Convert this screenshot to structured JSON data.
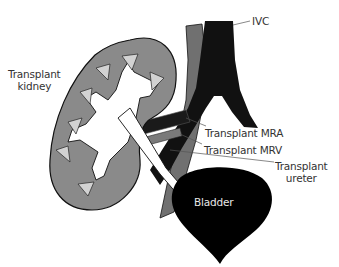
{
  "diagram": {
    "labels": {
      "kidney_line1": "Transplant",
      "kidney_line2": "kidney",
      "ivc": "IVC",
      "mra": "Transplant MRA",
      "mrv": "Transplant MRV",
      "ureter_line1": "Transplant",
      "ureter_line2": "ureter",
      "bladder": "Bladder"
    },
    "colors": {
      "kidney_cortex": "#8a8a8a",
      "kidney_pyramid": "#d2d2d2",
      "vessel_dark": "#111111",
      "vessel_grey": "#707070",
      "bladder": "#000000",
      "ureter": "#ffffff",
      "leader_line": "#555555",
      "text": "#333333"
    }
  }
}
